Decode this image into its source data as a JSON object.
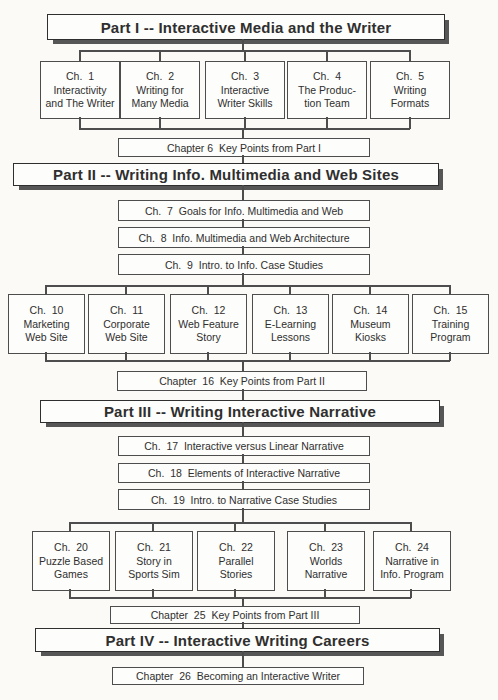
{
  "title": "The Book at a Glance",
  "colors": {
    "paper": "#fbfaf7",
    "ink": "#2f2f2f",
    "line": "#4d4d4d",
    "shadow": "#565656",
    "boxfill": "#fdfdfb"
  },
  "parts": [
    {
      "banner": "Part I -- Interactive Media and the Writer",
      "chapters": [
        {
          "id": "Ch.  1",
          "l1": "Interactivity",
          "l2": "and The Writer"
        },
        {
          "id": "Ch.  2",
          "l1": "Writing for",
          "l2": "Many Media"
        },
        {
          "id": "Ch.  3",
          "l1": "Interactive",
          "l2": "Writer Skills"
        },
        {
          "id": "Ch.  4",
          "l1": "The Produc-",
          "l2": "tion Team"
        },
        {
          "id": "Ch.  5",
          "l1": "Writing",
          "l2": "Formats"
        }
      ],
      "key_points": "Chapter 6  Key Points from Part I"
    },
    {
      "banner": "Part II -- Writing Info. Multimedia and Web Sites",
      "intro_chapters": [
        "Ch.  7  Goals for Info. Multimedia and Web",
        "Ch.  8  Info. Multimedia and Web Architecture",
        "Ch.  9  Intro. to Info. Case Studies"
      ],
      "chapters": [
        {
          "id": "Ch.  10",
          "l1": "Marketing",
          "l2": "Web Site"
        },
        {
          "id": "Ch.  11",
          "l1": "Corporate",
          "l2": "Web Site"
        },
        {
          "id": "Ch.  12",
          "l1": "Web Feature",
          "l2": "Story"
        },
        {
          "id": "Ch.  13",
          "l1": "E-Learning",
          "l2": "Lessons"
        },
        {
          "id": "Ch.  14",
          "l1": "Museum",
          "l2": "Kiosks"
        },
        {
          "id": "Ch.  15",
          "l1": "Training",
          "l2": "Program"
        }
      ],
      "key_points": "Chapter  16  Key Points from Part II"
    },
    {
      "banner": "Part III -- Writing Interactive Narrative",
      "intro_chapters": [
        "Ch.  17  Interactive versus Linear Narrative",
        "Ch.  18  Elements of Interactive Narrative",
        "Ch.  19  Intro. to Narrative Case Studies"
      ],
      "chapters": [
        {
          "id": "Ch.  20",
          "l1": "Puzzle Based",
          "l2": "Games"
        },
        {
          "id": "Ch.  21",
          "l1": "Story in",
          "l2": "Sports Sim"
        },
        {
          "id": "Ch.  22",
          "l1": "Parallel",
          "l2": "Stories"
        },
        {
          "id": "Ch.  23",
          "l1": "Worlds",
          "l2": "Narrative"
        },
        {
          "id": "Ch.  24",
          "l1": "Narrative in",
          "l2": "Info. Program"
        }
      ],
      "key_points": "Chapter  25  Key Points from Part III"
    },
    {
      "banner": "Part IV -- Interactive Writing Careers",
      "key_points": "Chapter  26  Becoming an Interactive Writer"
    }
  ]
}
